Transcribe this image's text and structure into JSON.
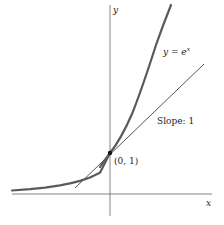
{
  "diagram": {
    "axes": {
      "x_label": "x",
      "y_label": "y"
    },
    "curve": {
      "label_prefix": "y = e",
      "label_exponent": "x",
      "color": "#555555"
    },
    "tangent": {
      "label": "Slope: 1",
      "color": "#555555"
    },
    "point": {
      "label": "(0, 1)",
      "x": 0,
      "y": 1
    }
  }
}
